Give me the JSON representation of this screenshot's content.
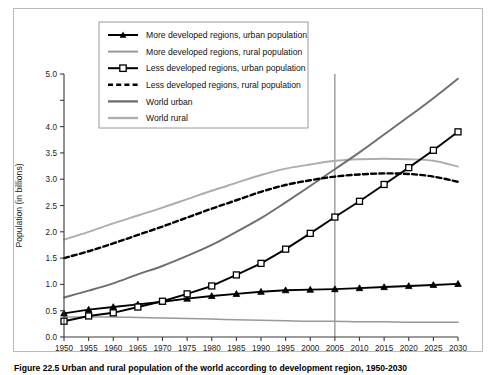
{
  "figure": {
    "caption": "Figure 22.5   Urban and rural population of the world according to development region, 1950-2030"
  },
  "chart_data": {
    "type": "line",
    "title": "",
    "xlabel": "",
    "ylabel": "Population (in billions)",
    "xlim": [
      1950,
      2030
    ],
    "ylim": [
      0.0,
      5.0
    ],
    "grid": false,
    "legend_position": "top-center",
    "x": [
      1950,
      1955,
      1960,
      1965,
      1970,
      1975,
      1980,
      1985,
      1990,
      1995,
      2000,
      2005,
      2010,
      2015,
      2020,
      2025,
      2030
    ],
    "xticklabels": [
      "1950",
      "1955",
      "1960",
      "1965",
      "1970",
      "1975",
      "1980",
      "1985",
      "1990",
      "1995",
      "2000",
      "2005",
      "2010",
      "2015",
      "2020",
      "2025",
      "2030"
    ],
    "yticks": [
      0.0,
      0.5,
      1.0,
      1.5,
      2.0,
      2.5,
      3.0,
      3.5,
      4.0,
      4.5,
      5.0
    ],
    "yticklabels": [
      "0.0",
      "0.5",
      "1.0",
      "1.5",
      "2.0",
      "2.5",
      "3.0",
      "3.5",
      "4.0",
      "4.5",
      "5.0"
    ],
    "ytick_hidden_by_legend": [
      "4.5"
    ],
    "annotations": [
      {
        "type": "vertical-reference-line",
        "x": 2005,
        "label": "2005"
      }
    ],
    "series": [
      {
        "name": "More developed regions, urban population",
        "style": "solid-marker-triangle",
        "color": "#000000",
        "marker": "triangle",
        "values": [
          0.45,
          0.52,
          0.57,
          0.62,
          0.67,
          0.73,
          0.78,
          0.82,
          0.86,
          0.89,
          0.9,
          0.91,
          0.93,
          0.95,
          0.97,
          0.99,
          1.01
        ]
      },
      {
        "name": "More developed regions, rural population",
        "style": "solid",
        "color": "#999999",
        "marker": "none",
        "values": [
          0.38,
          0.38,
          0.38,
          0.37,
          0.36,
          0.35,
          0.34,
          0.33,
          0.32,
          0.31,
          0.3,
          0.3,
          0.29,
          0.29,
          0.28,
          0.28,
          0.28
        ]
      },
      {
        "name": "Less developed regions, urban population",
        "style": "solid-marker-square",
        "color": "#000000",
        "marker": "square",
        "values": [
          0.3,
          0.4,
          0.46,
          0.57,
          0.68,
          0.82,
          0.97,
          1.18,
          1.4,
          1.67,
          1.97,
          2.28,
          2.58,
          2.9,
          3.22,
          3.55,
          3.9
        ]
      },
      {
        "name": "Less developed regions, rural population",
        "style": "dashed",
        "color": "#000000",
        "marker": "none",
        "values": [
          1.5,
          1.63,
          1.78,
          1.94,
          2.1,
          2.27,
          2.44,
          2.6,
          2.76,
          2.89,
          2.98,
          3.05,
          3.09,
          3.11,
          3.1,
          3.05,
          2.95
        ]
      },
      {
        "name": "World urban",
        "style": "solid",
        "color": "#6e6e6e",
        "marker": "none",
        "values": [
          0.75,
          0.88,
          1.02,
          1.19,
          1.35,
          1.54,
          1.75,
          2.0,
          2.26,
          2.56,
          2.87,
          3.19,
          3.51,
          3.85,
          4.19,
          4.54,
          4.91
        ]
      },
      {
        "name": "World rural",
        "style": "solid",
        "color": "#adadad",
        "marker": "none",
        "values": [
          1.85,
          2.0,
          2.16,
          2.31,
          2.46,
          2.62,
          2.78,
          2.93,
          3.08,
          3.2,
          3.28,
          3.35,
          3.38,
          3.39,
          3.38,
          3.35,
          3.24
        ]
      }
    ]
  },
  "legend": {
    "items": [
      {
        "label": "More developed regions, urban population",
        "swatch": "line-triangle-black"
      },
      {
        "label": "More developed regions, rural population",
        "swatch": "line-gray-mid"
      },
      {
        "label": "Less developed regions, urban population",
        "swatch": "line-square-black"
      },
      {
        "label": "Less developed regions, rural population",
        "swatch": "line-dashed-black"
      },
      {
        "label": "World urban",
        "swatch": "line-gray-dark"
      },
      {
        "label": "World rural",
        "swatch": "line-gray-light"
      }
    ]
  }
}
